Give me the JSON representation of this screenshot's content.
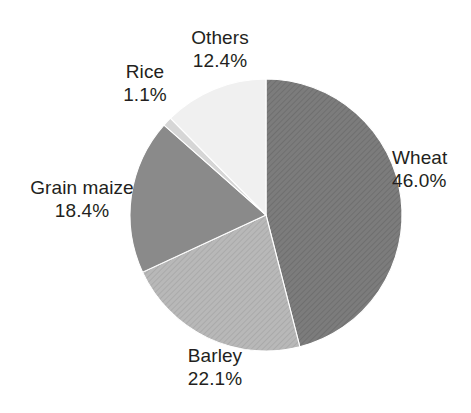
{
  "chart_data": {
    "type": "pie",
    "title": "",
    "subtitle": "",
    "xlabel": "",
    "ylabel": "",
    "legend_position": "none",
    "grid": false,
    "value_unit": "%",
    "start_angle_deg": 0,
    "direction": "clockwise",
    "categories": [
      "Wheat",
      "Barley",
      "Grain maize",
      "Rice",
      "Others"
    ],
    "values": [
      46.0,
      22.1,
      18.4,
      1.1,
      12.4
    ],
    "slices": [
      {
        "label": "Wheat",
        "value": 46.0,
        "value_text": "46.0%",
        "color": "#787878",
        "pattern": "diagonal-hatch",
        "label_position": "right"
      },
      {
        "label": "Barley",
        "value": 22.1,
        "value_text": "22.1%",
        "color": "#b4b4b4",
        "pattern": "diagonal-hatch",
        "label_position": "bottom"
      },
      {
        "label": "Grain maize",
        "value": 18.4,
        "value_text": "18.4%",
        "color": "#8a8a8a",
        "pattern": "solid",
        "label_position": "left"
      },
      {
        "label": "Rice",
        "value": 1.1,
        "value_text": "1.1%",
        "color": "#d6d6d6",
        "pattern": "solid",
        "label_position": "top-left"
      },
      {
        "label": "Others",
        "value": 12.4,
        "value_text": "12.4%",
        "color": "#f0f0f0",
        "pattern": "solid",
        "label_position": "top"
      }
    ]
  },
  "labels": {
    "wheat": {
      "name": "Wheat",
      "value": "46.0%"
    },
    "barley": {
      "name": "Barley",
      "value": "22.1%"
    },
    "grain_maize": {
      "name": "Grain maize",
      "value": "18.4%"
    },
    "rice": {
      "name": "Rice",
      "value": "1.1%"
    },
    "others": {
      "name": "Others",
      "value": "12.4%"
    }
  },
  "style": {
    "background": "#ffffff",
    "text_color": "#231f20",
    "outline_color": "#ffffff"
  }
}
